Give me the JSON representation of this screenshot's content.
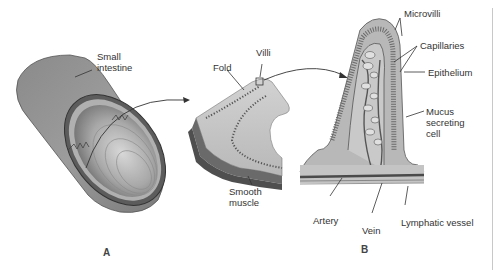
{
  "diagram": {
    "panels": [
      {
        "id": "A",
        "label": "A",
        "labels": {
          "small_intestine": "Small\nintestine",
          "fold": "Fold",
          "villi": "Villi",
          "smooth_muscle": "Smooth\nmuscle"
        }
      },
      {
        "id": "B",
        "label": "B",
        "labels": {
          "microvilli": "Microvilli",
          "capillaries": "Capillaries",
          "epithelium": "Epithelium",
          "mucus_secreting_cell": "Mucus\nsecreting\ncell",
          "artery": "Artery",
          "vein": "Vein",
          "lymphatic_vessel": "Lymphatic vessel"
        }
      }
    ],
    "colors": {
      "tissue_dark": "#6e6e6e",
      "tissue_mid": "#9a9a9a",
      "tissue_light": "#c9c9c9",
      "line": "#333333"
    }
  }
}
